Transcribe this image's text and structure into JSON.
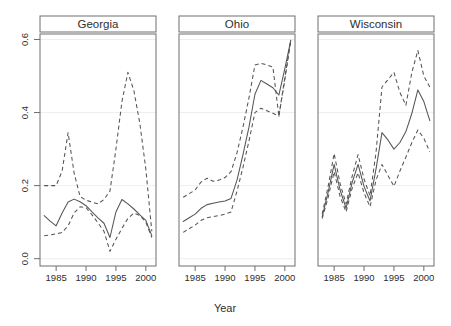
{
  "chart_data": {
    "type": "line",
    "title": "",
    "subtitle": "",
    "xlabel": "Year",
    "ylabel": "",
    "layout": "3 horizontal panels (lattice/trellis conditioned on state)",
    "grid": true,
    "gridlines_y": [
      0.0,
      0.2,
      0.4,
      0.6
    ],
    "legend": "none",
    "xlim": [
      1982.3,
      2001.7
    ],
    "ylim": [
      -0.02,
      0.615
    ],
    "xticks": [
      1985,
      1990,
      1995,
      2000
    ],
    "xtick_labels": [
      "1985",
      "1990",
      "1995",
      "2000"
    ],
    "yticks": [
      0.0,
      0.2,
      0.4,
      0.6
    ],
    "ytick_labels": [
      "0.0",
      "0.2",
      "0.4",
      "0.6"
    ],
    "x": [
      1983,
      1984,
      1985,
      1986,
      1987,
      1988,
      1989,
      1990,
      1991,
      1992,
      1993,
      1994,
      1995,
      1996,
      1997,
      1998,
      1999,
      2000,
      2001
    ],
    "panels": [
      {
        "name": "Georgia",
        "series": [
          {
            "name": "upper",
            "style": "dashed",
            "values": [
              0.2,
              0.2,
              0.2,
              0.24,
              0.345,
              0.235,
              0.17,
              0.16,
              0.155,
              0.15,
              0.162,
              0.185,
              0.3,
              0.43,
              0.51,
              0.46,
              0.37,
              0.245,
              0.075
            ]
          },
          {
            "name": "estimate",
            "style": "solid",
            "values": [
              0.118,
              0.103,
              0.09,
              0.125,
              0.155,
              0.163,
              0.156,
              0.145,
              0.128,
              0.112,
              0.097,
              0.058,
              0.128,
              0.162,
              0.15,
              0.136,
              0.12,
              0.105,
              0.063
            ]
          },
          {
            "name": "lower",
            "style": "dashed",
            "values": [
              0.063,
              0.065,
              0.068,
              0.072,
              0.09,
              0.125,
              0.142,
              0.14,
              0.12,
              0.098,
              0.075,
              0.02,
              0.053,
              0.083,
              0.11,
              0.125,
              0.118,
              0.1,
              0.058
            ]
          }
        ]
      },
      {
        "name": "Ohio",
        "series": [
          {
            "name": "upper",
            "style": "dashed",
            "values": [
              0.168,
              0.178,
              0.188,
              0.21,
              0.22,
              0.212,
              0.215,
              0.222,
              0.238,
              0.29,
              0.36,
              0.44,
              0.53,
              0.535,
              0.53,
              0.525,
              0.39,
              0.49,
              0.598
            ]
          },
          {
            "name": "estimate",
            "style": "solid",
            "values": [
              0.102,
              0.112,
              0.122,
              0.138,
              0.148,
              0.152,
              0.155,
              0.158,
              0.165,
              0.215,
              0.285,
              0.36,
              0.45,
              0.488,
              0.478,
              0.468,
              0.448,
              0.52,
              0.598
            ]
          },
          {
            "name": "lower",
            "style": "dashed",
            "values": [
              0.072,
              0.082,
              0.092,
              0.105,
              0.112,
              0.115,
              0.118,
              0.122,
              0.128,
              0.185,
              0.25,
              0.322,
              0.4,
              0.412,
              0.405,
              0.398,
              0.39,
              0.495,
              0.598
            ]
          }
        ]
      },
      {
        "name": "Wisconsin",
        "series": [
          {
            "name": "upper",
            "style": "dashed",
            "values": [
              0.122,
              0.198,
              0.288,
              0.205,
              0.15,
              0.225,
              0.285,
              0.218,
              0.172,
              0.29,
              0.47,
              0.49,
              0.51,
              0.455,
              0.42,
              0.51,
              0.57,
              0.5,
              0.47
            ]
          },
          {
            "name": "estimate",
            "style": "solid",
            "values": [
              0.115,
              0.182,
              0.258,
              0.188,
              0.138,
              0.208,
              0.258,
              0.198,
              0.158,
              0.245,
              0.345,
              0.325,
              0.3,
              0.318,
              0.348,
              0.398,
              0.462,
              0.43,
              0.378
            ]
          },
          {
            "name": "lower",
            "style": "dashed",
            "values": [
              0.11,
              0.168,
              0.238,
              0.17,
              0.128,
              0.192,
              0.235,
              0.18,
              0.142,
              0.215,
              0.258,
              0.228,
              0.198,
              0.24,
              0.278,
              0.318,
              0.352,
              0.33,
              0.292
            ]
          }
        ]
      }
    ]
  },
  "axes": {
    "xlabel": "Year",
    "ytick_labels": [
      "0.0",
      "0.2",
      "0.4",
      "0.6"
    ],
    "xtick_labels": [
      "1985",
      "1990",
      "1995",
      "2000"
    ]
  },
  "strips": {
    "panel_0": "Georgia",
    "panel_1": "Ohio",
    "panel_2": "Wisconsin"
  },
  "colors": {
    "line": "#555555",
    "frame": "#6e6e6e",
    "grid": "#eceff1",
    "text": "#2e2e2e",
    "background": "#ffffff"
  }
}
